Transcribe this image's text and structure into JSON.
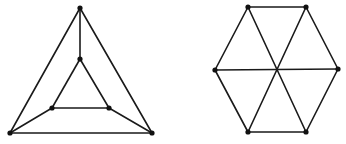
{
  "canvas": {
    "width": 346,
    "height": 144,
    "background": "#ffffff"
  },
  "style": {
    "edge_color": "#1a1a1a",
    "vertex_color": "#111111",
    "vertex_radius": 2.6
  },
  "graphs": [
    {
      "name": "nested-triangle-graph",
      "vertices": [
        {
          "id": "a",
          "x": 80,
          "y": 8
        },
        {
          "id": "b",
          "x": 80,
          "y": 59
        },
        {
          "id": "c",
          "x": 52,
          "y": 108
        },
        {
          "id": "d",
          "x": 109,
          "y": 108
        },
        {
          "id": "e",
          "x": 10,
          "y": 133
        },
        {
          "id": "f",
          "x": 152,
          "y": 133
        }
      ],
      "edges": [
        [
          "a",
          "e"
        ],
        [
          "a",
          "f"
        ],
        [
          "e",
          "f"
        ],
        [
          "b",
          "c"
        ],
        [
          "b",
          "d"
        ],
        [
          "c",
          "d"
        ],
        [
          "a",
          "b"
        ],
        [
          "e",
          "c"
        ],
        [
          "f",
          "d"
        ]
      ]
    },
    {
      "name": "hexagon-graph",
      "vertices": [
        {
          "id": "p",
          "x": 248,
          "y": 7
        },
        {
          "id": "q",
          "x": 306,
          "y": 7
        },
        {
          "id": "r",
          "x": 338,
          "y": 69
        },
        {
          "id": "s",
          "x": 306,
          "y": 132
        },
        {
          "id": "t",
          "x": 248,
          "y": 132
        },
        {
          "id": "u",
          "x": 215,
          "y": 70
        }
      ],
      "edges": [
        [
          "p",
          "q"
        ],
        [
          "q",
          "r"
        ],
        [
          "r",
          "s"
        ],
        [
          "s",
          "t"
        ],
        [
          "t",
          "u"
        ],
        [
          "u",
          "p"
        ],
        [
          "p",
          "s"
        ],
        [
          "q",
          "t"
        ],
        [
          "u",
          "r"
        ]
      ]
    }
  ]
}
